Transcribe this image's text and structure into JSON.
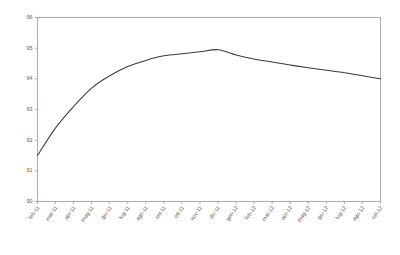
{
  "chart_data": {
    "type": "line",
    "title": "",
    "subtitle": "",
    "xlabel": "",
    "ylabel": "",
    "grid": false,
    "legend": false,
    "legend_position": "none",
    "line_color": "#3a3a3a",
    "frame_color": "#9a9a9a",
    "background_color": "#ffffff",
    "ylim": [
      90,
      96
    ],
    "yticks": [
      90,
      91,
      92,
      93,
      94,
      95,
      96
    ],
    "ytick_labels": [
      "90",
      "91",
      "92",
      "93",
      "94",
      "95",
      "96"
    ],
    "categories": [
      "feb-11",
      "mar-11",
      "apr-11",
      "mag-11",
      "giu-11",
      "lug-11",
      "ago-11",
      "set-11",
      "ott-11",
      "nov-11",
      "dic-11",
      "gen-12",
      "feb-12",
      "mar-12",
      "apr-12",
      "mag-12",
      "giu-12",
      "lug-12",
      "ago-12",
      "set-12"
    ],
    "values": [
      91.5,
      92.4,
      93.1,
      93.7,
      94.1,
      94.4,
      94.6,
      94.75,
      94.82,
      94.88,
      94.95,
      94.78,
      94.65,
      94.55,
      94.45,
      94.36,
      94.28,
      94.2,
      94.1,
      94.0
    ],
    "series": [
      {
        "name": "serie1",
        "values": [
          91.5,
          92.4,
          93.1,
          93.7,
          94.1,
          94.4,
          94.6,
          94.75,
          94.82,
          94.88,
          94.95,
          94.78,
          94.65,
          94.55,
          94.45,
          94.36,
          94.28,
          94.2,
          94.1,
          94.0
        ]
      }
    ]
  }
}
